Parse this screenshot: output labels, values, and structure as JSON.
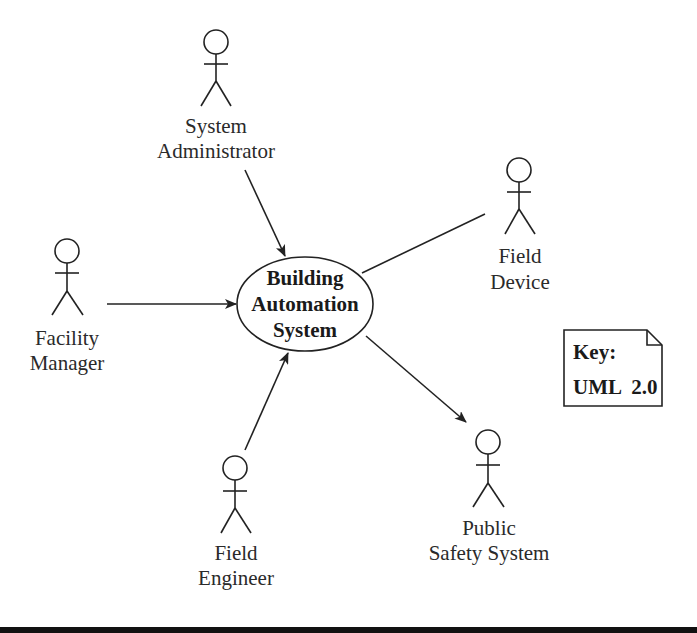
{
  "diagram": {
    "type": "UML use case context diagram",
    "system": {
      "line1": "Building",
      "line2": "Automation",
      "line3": "System"
    },
    "actors": [
      {
        "id": "system-administrator",
        "line1": "System",
        "line2": "Administrator"
      },
      {
        "id": "field-device",
        "line1": "Field",
        "line2": "Device"
      },
      {
        "id": "facility-manager",
        "line1": "Facility",
        "line2": "Manager"
      },
      {
        "id": "field-engineer",
        "line1": "Field",
        "line2": "Engineer"
      },
      {
        "id": "public-safety-system",
        "line1": "Public",
        "line2": "Safety System"
      }
    ],
    "connections": [
      {
        "from": "System Administrator",
        "to": "Building Automation System",
        "arrow": "to-system"
      },
      {
        "from": "Field Device",
        "to": "Building Automation System",
        "arrow": "none"
      },
      {
        "from": "Facility Manager",
        "to": "Building Automation System",
        "arrow": "to-system"
      },
      {
        "from": "Field Engineer",
        "to": "Building Automation System",
        "arrow": "to-system"
      },
      {
        "from": "Building Automation System",
        "to": "Public Safety System",
        "arrow": "to-actor"
      }
    ],
    "key": {
      "title": "Key:",
      "notation": "UML  2.0"
    }
  },
  "colors": {
    "line": "#222222",
    "text": "#2a2a2a",
    "background": "#ffffff",
    "bottom_bar": "#111111"
  }
}
